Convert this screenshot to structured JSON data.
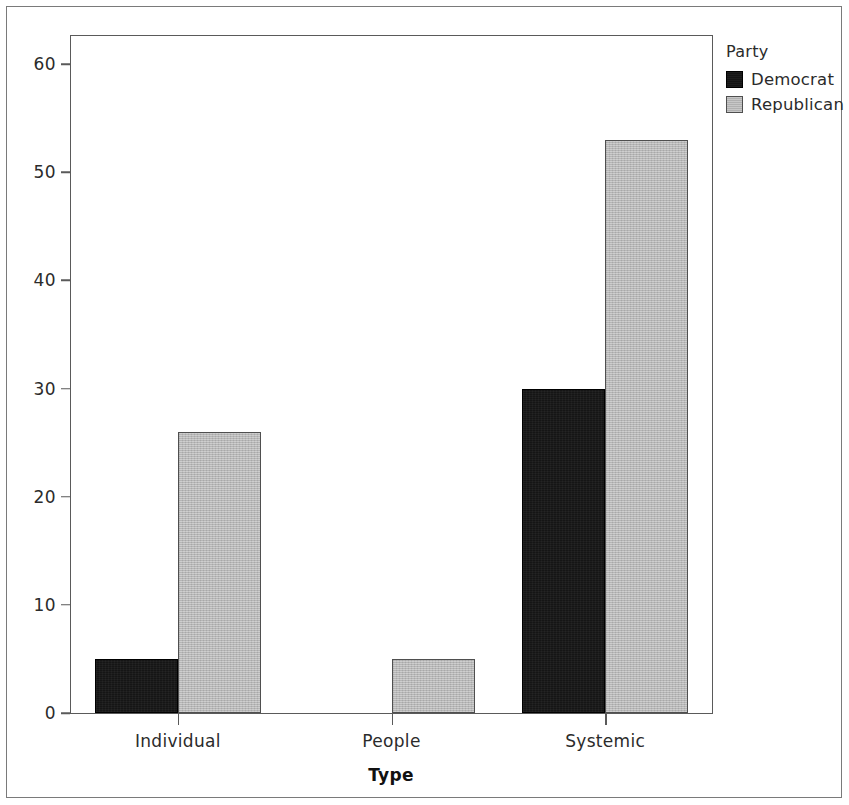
{
  "chart_data": {
    "type": "bar",
    "title": "",
    "subtitle": "",
    "xlabel": "Type",
    "ylabel": "",
    "categories": [
      "Individual",
      "People",
      "Systemic"
    ],
    "series": [
      {
        "name": "Democrat",
        "color": "#151515",
        "values": [
          5,
          0,
          30
        ]
      },
      {
        "name": "Republican",
        "color": "#b9b9b9",
        "values": [
          26,
          5,
          53
        ]
      }
    ],
    "legend": {
      "title": "Party",
      "position": "right-top",
      "entries": [
        {
          "label": "Democrat",
          "color": "#151515",
          "swatch": "legend-swatch-democrat"
        },
        {
          "label": "Republican",
          "color": "#b9b9b9",
          "swatch": "legend-swatch-republican"
        }
      ]
    },
    "yticks": [
      0,
      10,
      20,
      30,
      40,
      50,
      60
    ],
    "ytick_labels": [
      "0",
      "10",
      "20",
      "30",
      "40",
      "50",
      "60"
    ],
    "ylim": [
      0,
      62.6
    ],
    "xtick_labels": [
      "Individual",
      "People",
      "Systemic"
    ],
    "grid": false,
    "bar_mode": "grouped",
    "frame": true
  },
  "axis": {
    "x_title": "Type"
  },
  "colors": {
    "democrat": "#151515",
    "republican": "#b9b9b9",
    "axis": "#5a5a5a",
    "text": "#2b2b2b",
    "page_border": "#7a7a7a"
  }
}
